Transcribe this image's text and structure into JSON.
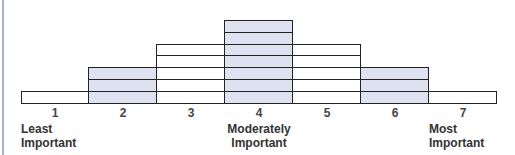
{
  "chart_data": {
    "type": "bar",
    "title": "",
    "categories": [
      "1",
      "2",
      "3",
      "4",
      "5",
      "6",
      "7"
    ],
    "values": [
      1,
      3,
      5,
      7,
      5,
      3,
      1
    ],
    "shaded": [
      false,
      true,
      false,
      true,
      false,
      true,
      false
    ],
    "xlabel": "",
    "ylabel": "",
    "annotations": [
      {
        "category": "1",
        "text": "Least Important"
      },
      {
        "category": "4",
        "text": "Moderately Important"
      },
      {
        "category": "7",
        "text": "Most Important"
      }
    ],
    "grid": false
  },
  "colors": {
    "shaded": "#dde1f0",
    "unshaded": "#ffffff",
    "border": "#222222"
  },
  "labels": {
    "least_1": "Least",
    "least_2": "Important",
    "mod_1": "Moderately",
    "mod_2": "Important",
    "most_1": "Most",
    "most_2": "Important"
  }
}
